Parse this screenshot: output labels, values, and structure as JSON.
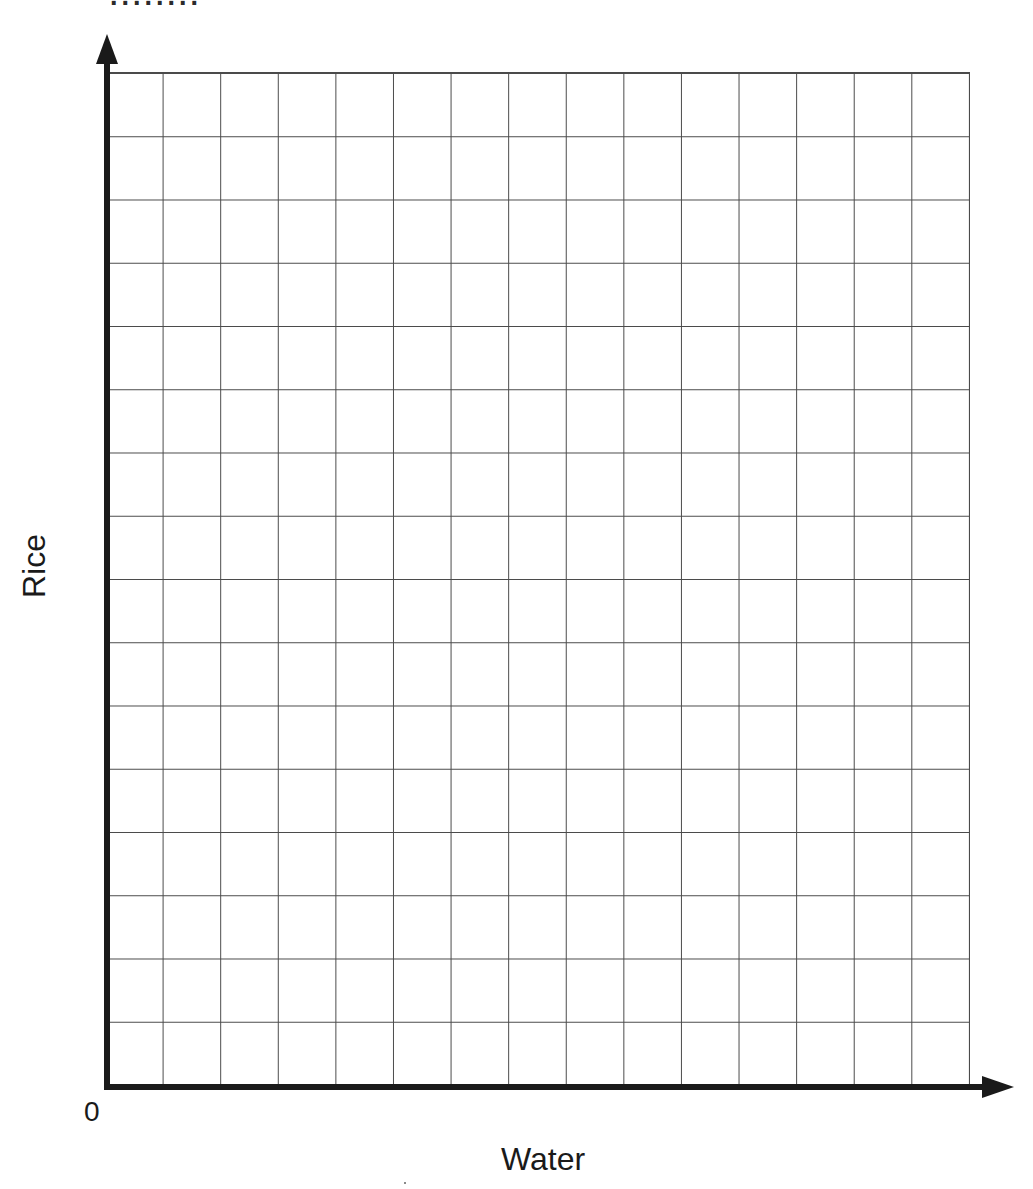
{
  "page": {
    "background_color": "#ffffff",
    "clipped_text_top": "........"
  },
  "chart_data": {
    "type": "scatter",
    "title": "",
    "xlabel": "Water",
    "ylabel": "Rice",
    "origin_label": "0",
    "series": [],
    "empty_grid": true,
    "grid": {
      "columns": 15,
      "rows": 16,
      "grid_on": true
    },
    "axis_color": "#1a1a1a",
    "grid_line_color": "#4a4a4a",
    "legend_position": "none"
  }
}
